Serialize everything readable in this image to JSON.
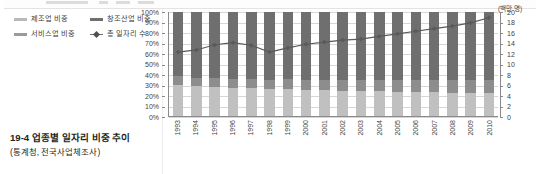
{
  "caption": {
    "number": "19-4",
    "title": "업종별 일자리 비중 추이",
    "source": "(통계청, 전국사업체조사)"
  },
  "legend": {
    "items": [
      {
        "label": "제조업 비중",
        "color": "#b9b9b9",
        "type": "swatch"
      },
      {
        "label": "창조산업 비중",
        "color": "#6f6f6f",
        "type": "swatch"
      },
      {
        "label": "서비스업 비중",
        "color": "#9a9a9a",
        "type": "swatch"
      },
      {
        "label": "총 일자리 수",
        "color": "#5a5a5a",
        "type": "line"
      }
    ]
  },
  "axes": {
    "left_unit": "",
    "right_unit": "(백만 명)",
    "left_ticks": [
      "100%",
      "90%",
      "80%",
      "70%",
      "60%",
      "50%",
      "40%",
      "30%",
      "20%",
      "10%",
      "0%"
    ],
    "right_ticks": [
      "20",
      "18",
      "16",
      "14",
      "12",
      "10",
      "8",
      "6",
      "4",
      "2",
      "0"
    ]
  },
  "chart_data": {
    "type": "bar",
    "title": "업종별 일자리 비중 추이",
    "subtitle": "(통계청, 전국사업체조사)",
    "xlabel": "",
    "ylabel": "",
    "y2label": "(백만 명)",
    "ylim": [
      0,
      100
    ],
    "y2lim": [
      0,
      20
    ],
    "grid": true,
    "legend_position": "top-left",
    "stacked": true,
    "categories": [
      "1993",
      "1994",
      "1995",
      "1996",
      "1997",
      "1998",
      "1999",
      "2000",
      "2001",
      "2002",
      "2003",
      "2004",
      "2005",
      "2006",
      "2007",
      "2008",
      "2009",
      "2010"
    ],
    "series": [
      {
        "name": "제조업 비중",
        "color": "#c0c0c0",
        "axis": "left",
        "unit": "%",
        "values": [
          30,
          29,
          28,
          27,
          27,
          26,
          26,
          25,
          25,
          24,
          24,
          24,
          23,
          23,
          23,
          22,
          22,
          22
        ]
      },
      {
        "name": "창조산업 비중",
        "color": "#8d8d8d",
        "axis": "left",
        "unit": "%",
        "values": [
          8,
          8,
          9,
          9,
          9,
          9,
          10,
          10,
          10,
          11,
          11,
          11,
          12,
          12,
          12,
          13,
          13,
          13
        ]
      },
      {
        "name": "서비스업 비중",
        "color": "#6f6f6f",
        "axis": "left",
        "unit": "%",
        "values": [
          62,
          63,
          63,
          64,
          64,
          65,
          64,
          65,
          65,
          65,
          65,
          65,
          65,
          65,
          65,
          65,
          65,
          65
        ]
      },
      {
        "name": "총 일자리 수",
        "color": "#5a5a5a",
        "axis": "right",
        "unit": "백만 명",
        "type": "line",
        "values": [
          12.3,
          12.7,
          13.7,
          14.1,
          13.6,
          12.3,
          13.1,
          13.8,
          14.2,
          14.6,
          14.8,
          15.3,
          15.8,
          16.3,
          16.8,
          17.3,
          17.9,
          18.9
        ]
      }
    ]
  }
}
